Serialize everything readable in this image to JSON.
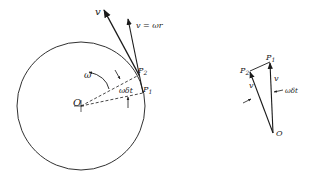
{
  "figure": {
    "left_diagram": {
      "title": "Point on rotating circle",
      "labels": {
        "velocity_v": "v",
        "velocity_eq": "v = ωr",
        "omega": "ω",
        "angle": "ωδt",
        "point_p2": "P",
        "point_p2_sub": "2",
        "point_p1": "P",
        "point_p1_sub": "1",
        "origin": "O"
      }
    },
    "right_diagram": {
      "title": "Velocity triangle",
      "labels": {
        "point_p1": "P",
        "point_p1_sub": "1",
        "point_p2": "P",
        "point_p2_sub": "2",
        "v_left": "v",
        "v_right": "v",
        "angle": "ωδt",
        "origin": "O"
      }
    },
    "colors": {
      "ink": "#1a1a1a",
      "background": "#ffffff"
    }
  }
}
